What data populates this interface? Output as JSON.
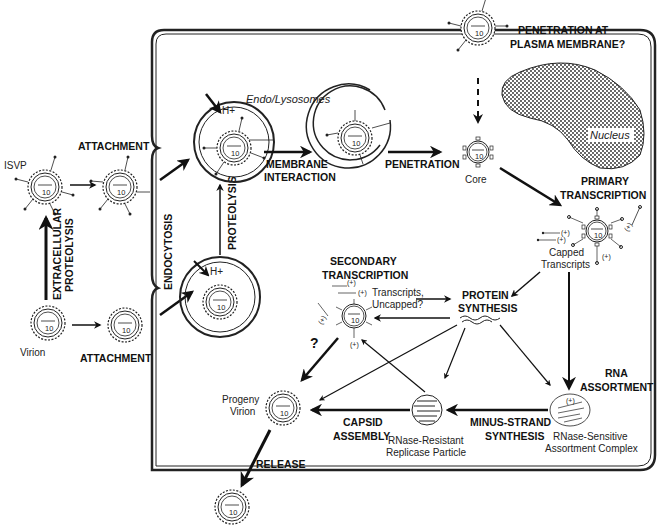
{
  "particles": {
    "isvp": "ISVP",
    "virion": "Virion",
    "core": "Core",
    "progeny_virion_1": "Progeny",
    "progeny_virion_2": "Virion",
    "capped_transcripts_1": "Capped",
    "capped_transcripts_2": "Transcripts",
    "replicase_1": "RNase-Resistant",
    "replicase_2": "Replicase Particle",
    "assortment_1": "RNase-Sensitive",
    "assortment_2": "Assortment Complex",
    "segment_count": "10"
  },
  "compartments": {
    "endo_lysosomes": "Endo/Lysosomes",
    "nucleus": "Nucleus",
    "proton": "H+"
  },
  "steps": {
    "attachment_top": "ATTACHMENT",
    "attachment_bottom": "ATTACHMENT",
    "extracellular_proteolysis_1": "EXTRACELLULAR",
    "extracellular_proteolysis_2": "PROTEOLYSIS",
    "endocytosis": "ENDOCYTOSIS",
    "proteolysis": "PROTEOLYSIS",
    "membrane_interaction_1": "MEMBRANE",
    "membrane_interaction_2": "INTERACTION",
    "penetration": "PENETRATION",
    "penetration_plasma_1": "PENETRATION AT",
    "penetration_plasma_2": "PLASMA MEMBRANE?",
    "primary_transcription_1": "PRIMARY",
    "primary_transcription_2": "TRANSCRIPTION",
    "secondary_transcription_1": "SECONDARY",
    "secondary_transcription_2": "TRANSCRIPTION",
    "transcripts_uncapped_1": "Transcripts,",
    "transcripts_uncapped_2": "Uncapped?",
    "protein_synthesis_1": "PROTEIN",
    "protein_synthesis_2": "SYNTHESIS",
    "rna_assortment_1": "RNA",
    "rna_assortment_2": "ASSORTMENT",
    "minus_strand_1": "MINUS-STRAND",
    "minus_strand_2": "SYNTHESIS",
    "capsid_assembly_1": "CAPSID",
    "capsid_assembly_2": "ASSEMBLY",
    "release": "RELEASE",
    "question": "?",
    "plus_strand": "(+)"
  }
}
